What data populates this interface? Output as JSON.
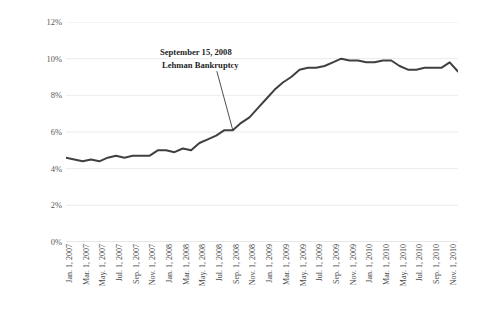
{
  "chart_data": {
    "type": "line",
    "title": "",
    "xlabel": "",
    "ylabel": "Unemployment Rate",
    "ylim": [
      0,
      12
    ],
    "y_ticks": [
      "0%",
      "2%",
      "4%",
      "6%",
      "8%",
      "10%",
      "12%"
    ],
    "y_tick_values": [
      0,
      2,
      4,
      6,
      8,
      10,
      12
    ],
    "grid": true,
    "legend": "none",
    "line_color": "#404040",
    "x_tick_labels": [
      "Jan. 1, 2007",
      "Mar. 1, 2007",
      "May. 1, 2007",
      "Jul. 1, 2007",
      "Sep. 1, 2007",
      "Nov. 1, 2007",
      "Jan. 1, 2008",
      "Mar. 1, 2008",
      "May. 1, 2008",
      "Jul. 1, 2008",
      "Sep. 1, 2008",
      "Nov. 1, 2008",
      "Jan. 1, 2009",
      "Mar. 1, 2009",
      "May. 1, 2009",
      "Jul. 1, 2009",
      "Sep. 1, 2009",
      "Nov. 1, 2009",
      "Jan. 1, 2010",
      "Mar. 1, 2010",
      "May. 1, 2010",
      "Jul. 1, 2010",
      "Sep. 1, 2010",
      "Nov. 1, 2010"
    ],
    "x": [
      "Jan 2007",
      "Feb 2007",
      "Mar 2007",
      "Apr 2007",
      "May 2007",
      "Jun 2007",
      "Jul 2007",
      "Aug 2007",
      "Sep 2007",
      "Oct 2007",
      "Nov 2007",
      "Dec 2007",
      "Jan 2008",
      "Feb 2008",
      "Mar 2008",
      "Apr 2008",
      "May 2008",
      "Jun 2008",
      "Jul 2008",
      "Aug 2008",
      "Sep 2008",
      "Oct 2008",
      "Nov 2008",
      "Dec 2008",
      "Jan 2009",
      "Feb 2009",
      "Mar 2009",
      "Apr 2009",
      "May 2009",
      "Jun 2009",
      "Jul 2009",
      "Aug 2009",
      "Sep 2009",
      "Oct 2009",
      "Nov 2009",
      "Dec 2009",
      "Jan 2010",
      "Feb 2010",
      "Mar 2010",
      "Apr 2010",
      "May 2010",
      "Jun 2010",
      "Jul 2010",
      "Aug 2010",
      "Sep 2010",
      "Oct 2010",
      "Nov 2010",
      "Dec 2010"
    ],
    "values": [
      4.6,
      4.5,
      4.4,
      4.5,
      4.4,
      4.6,
      4.7,
      4.6,
      4.7,
      4.7,
      4.7,
      5.0,
      5.0,
      4.9,
      5.1,
      5.0,
      5.4,
      5.6,
      5.8,
      6.1,
      6.1,
      6.5,
      6.8,
      7.3,
      7.8,
      8.3,
      8.7,
      9.0,
      9.4,
      9.5,
      9.5,
      9.6,
      9.8,
      10.0,
      9.9,
      9.9,
      9.8,
      9.8,
      9.9,
      9.9,
      9.6,
      9.4,
      9.4,
      9.5,
      9.5,
      9.5,
      9.8,
      9.3
    ],
    "series": [
      {
        "name": "Unemployment Rate",
        "values": [
          4.6,
          4.5,
          4.4,
          4.5,
          4.4,
          4.6,
          4.7,
          4.6,
          4.7,
          4.7,
          4.7,
          5.0,
          5.0,
          4.9,
          5.1,
          5.0,
          5.4,
          5.6,
          5.8,
          6.1,
          6.1,
          6.5,
          6.8,
          7.3,
          7.8,
          8.3,
          8.7,
          9.0,
          9.4,
          9.5,
          9.5,
          9.6,
          9.8,
          10.0,
          9.9,
          9.9,
          9.8,
          9.8,
          9.9,
          9.9,
          9.6,
          9.4,
          9.4,
          9.5,
          9.5,
          9.5,
          9.8,
          9.3
        ]
      }
    ],
    "annotations": [
      {
        "line1": "September 15, 2008",
        "line2": "Lehman Bankruptcy",
        "points_to_x": "Sep 2008",
        "points_to_y": 6.1
      }
    ]
  },
  "annotation": {
    "line1": "September 15, 2008",
    "line2": "Lehman Bankruptcy"
  },
  "axis": {
    "y_title": "Unemployment Rate"
  }
}
